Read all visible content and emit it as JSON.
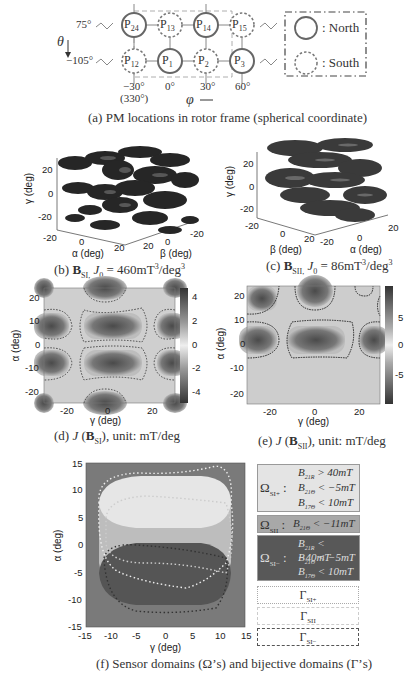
{
  "panel_a": {
    "theta_top": "75°",
    "theta_bottom": "−105°",
    "theta_symbol": "θ",
    "phi_symbol": "φ",
    "top_row": [
      "P24",
      "P13",
      "P14",
      "P15"
    ],
    "top_row_sub": [
      "24",
      "13",
      "14",
      "15"
    ],
    "bottom_row_sub": [
      "12",
      "1",
      "2",
      "3"
    ],
    "top_polarity": [
      "north",
      "south",
      "north",
      "south"
    ],
    "bottom_polarity": [
      "south",
      "north",
      "south",
      "north"
    ],
    "phi_ticks": [
      "−30°",
      "0°",
      "30°",
      "60°"
    ],
    "phi_tick_extra": "(330°)",
    "legend_north": ": North",
    "legend_south": ": South",
    "caption": "(a) PM locations in rotor frame (spherical coordinate)"
  },
  "panel_b": {
    "ylabel": "γ (deg)",
    "xlabel": "α (deg)",
    "zlabel": "β (deg)",
    "y_ticks": [
      "20",
      "0",
      "-20"
    ],
    "x_ticks": [
      "-20",
      "0",
      "20"
    ],
    "z_ticks": [
      "20",
      "0",
      "-20"
    ],
    "caption_prefix": "(b) ",
    "caption_B": "B",
    "caption_sub": "SI,",
    "caption_rest": " J",
    "caption_j_sub": "0",
    "caption_eq": " = 460mT",
    "caption_sup": "3",
    "caption_unit": "/deg",
    "caption_sup2": "3"
  },
  "panel_c": {
    "ylabel": "γ (deg)",
    "xlabel": "α (deg)",
    "zlabel": "β (deg)",
    "y_ticks": [
      "20",
      "0",
      "-20"
    ],
    "b_ticks": [
      "-20",
      "0",
      "20"
    ],
    "a_ticks": [
      "-20",
      "0",
      "20"
    ],
    "caption_prefix": "(c) ",
    "caption_B": "B",
    "caption_sub": "SII,",
    "caption_rest": " J",
    "caption_j_sub": "0",
    "caption_eq": " = 86mT",
    "caption_sup": "3",
    "caption_unit": "/deg",
    "caption_sup2": "3"
  },
  "panel_d": {
    "ylabel": "α (deg)",
    "xlabel": "γ (deg)",
    "y_ticks": [
      "20",
      "10",
      "0",
      "-10",
      "-20"
    ],
    "x_ticks": [
      "-20",
      "0",
      "20"
    ],
    "cbar_ticks": [
      "4",
      "2",
      "0",
      "-2",
      "-4"
    ],
    "caption_prefix": "(d) ",
    "caption_J": "J",
    "caption_open": " (",
    "caption_B": "B",
    "caption_sub": "SI",
    "caption_close": "), unit: mT/deg"
  },
  "panel_e": {
    "ylabel": "α (deg)",
    "xlabel": "γ (deg)",
    "y_ticks": [
      "20",
      "10",
      "0",
      "-10",
      "-20"
    ],
    "x_ticks": [
      "-20",
      "0",
      "20"
    ],
    "cbar_ticks": [
      "5",
      "0",
      "-5"
    ],
    "caption_prefix": "(e) ",
    "caption_J": "J",
    "caption_open": " (",
    "caption_B": "B",
    "caption_sub": "SII",
    "caption_close": "), unit: mT/deg"
  },
  "panel_f": {
    "ylabel": "α (deg)",
    "xlabel": "γ (deg)",
    "y_ticks": [
      "15",
      "10",
      "5",
      "0",
      "-5",
      "-10",
      "-15"
    ],
    "x_ticks": [
      "-15",
      "-10",
      "-5",
      "0",
      "5",
      "10",
      "15"
    ],
    "legend": {
      "omega_si_plus": {
        "label": "Ω",
        "sub": "SI+",
        "lines": [
          {
            "var": "B",
            "sub": "21R",
            "cond": " > 40mT"
          },
          {
            "var": "B",
            "sub": "21Θ",
            "cond": " < −5mT"
          },
          {
            "var": "B",
            "sub": "17Θ",
            "cond": " < 10mT"
          }
        ]
      },
      "omega_sii": {
        "label": "Ω",
        "sub": "SII",
        "lines": [
          {
            "var": "B",
            "sub": "21Θ",
            "cond": " < −11mT"
          }
        ]
      },
      "omega_si_minus": {
        "label": "Ω",
        "sub": "SI−",
        "lines": [
          {
            "var": "B",
            "sub": "21R",
            "cond": " < −40mT"
          },
          {
            "var": "B",
            "sub": "21Θ",
            "cond": " < −5mT"
          },
          {
            "var": "B",
            "sub": "17Θ",
            "cond": " < 10mT"
          }
        ]
      },
      "gamma_si_plus": {
        "label": "Γ",
        "sub": "SI+"
      },
      "gamma_sii": {
        "label": "Γ",
        "sub": "SII"
      },
      "gamma_si_minus": {
        "label": "Γ",
        "sub": "SI−"
      }
    },
    "caption": "(f) Sensor domains (Ω’s) and bijective domains (Γ’s)"
  },
  "colors": {
    "omega_si_plus": "#e4e4e4",
    "omega_sii": "#a8a8a8",
    "omega_si_minus": "#585858",
    "background_f": "#7a7a7a",
    "blob": "#2a2a2a"
  }
}
